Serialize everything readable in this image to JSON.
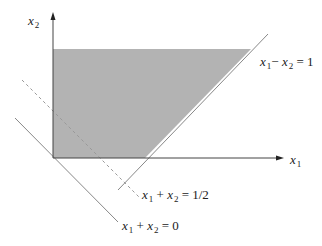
{
  "diagram": {
    "type": "feasible-region-plot",
    "axes": {
      "x_label": {
        "var": "x",
        "sub": "1"
      },
      "y_label": {
        "var": "x",
        "sub": "2"
      }
    },
    "region": {
      "description": "shaded feasible region bounded by x1 >= 0, x2 <= const, and x1 - x2 <= 1",
      "fill": "#b3b3b3"
    },
    "lines": [
      {
        "id": "line-x1-minus-x2-eq-1",
        "style": "solid",
        "lhs_var1": "x",
        "lhs_sub1": "1",
        "op": "−",
        "lhs_var2": "x",
        "lhs_sub2": "2",
        "rhs": "= 1"
      },
      {
        "id": "line-x1-plus-x2-eq-half",
        "style": "dashed",
        "lhs_var1": "x",
        "lhs_sub1": "1",
        "op": "+",
        "lhs_var2": "x",
        "lhs_sub2": "2",
        "rhs": "= 1/2"
      },
      {
        "id": "line-x1-plus-x2-eq-0",
        "style": "solid",
        "lhs_var1": "x",
        "lhs_sub1": "1",
        "op": "+",
        "lhs_var2": "x",
        "lhs_sub2": "2",
        "rhs": "= 0"
      }
    ],
    "colors": {
      "axis": "#333333",
      "line": "#777777",
      "dashed": "#999999",
      "region": "#b3b3b3"
    }
  }
}
